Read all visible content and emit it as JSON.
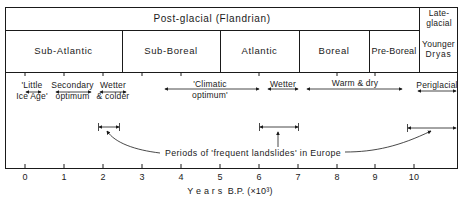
{
  "header": {
    "post_glacial": "Post-glacial (Flandrian)",
    "late_glacial_line1": "Late-",
    "late_glacial_line2": "glacial"
  },
  "zones": [
    {
      "label": "Sub-Atlantic",
      "from": -0.5,
      "to": 2.5
    },
    {
      "label": "Sub-Boreal",
      "from": 2.5,
      "to": 5.0
    },
    {
      "label": "Atlantic",
      "from": 5.0,
      "to": 7.0
    },
    {
      "label": "Boreal",
      "from": 7.0,
      "to": 8.8
    },
    {
      "label": "Pre-Boreal",
      "from": 8.8,
      "to": 10.1
    },
    {
      "label_line1": "Younger",
      "label_line2": "Dryas",
      "from": 10.1,
      "to": 11.1
    }
  ],
  "climate": {
    "little_ice_age_1": "'Little",
    "little_ice_age_2": "Ice Age'",
    "secondary_1": "Secondary",
    "secondary_2": "optimum",
    "wetter_colder_1": "Wetter",
    "wetter_colder_2": "& colder",
    "climatic_1": "'Climatic",
    "climatic_2": "optimum'",
    "wetter": "Wetter",
    "warm_dry": "Warm & dry",
    "periglacial": "Periglacial"
  },
  "landslides": {
    "label": "Periods of 'frequent landslides' in Europe",
    "periods": [
      {
        "from": 1.8,
        "to": 2.5
      },
      {
        "from": 6.0,
        "to": 7.0
      },
      {
        "from": 9.8,
        "to": 11.1
      }
    ]
  },
  "axis": {
    "ticks": [
      "0",
      "1",
      "2",
      "3",
      "4",
      "5",
      "6",
      "7",
      "8",
      "9",
      "10"
    ],
    "label": "Y e a r s  B.P. (×10³)"
  },
  "colors": {
    "ink": "#1a1a1a",
    "background": "#ffffff"
  }
}
